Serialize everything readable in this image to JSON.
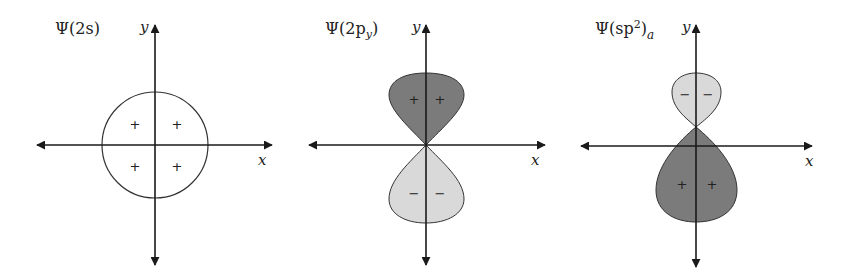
{
  "diagrams": [
    {
      "title": "Ψ(2s)",
      "title_main": "Ψ(2s)",
      "x_label": "x",
      "y_label": "y",
      "shape": "circle",
      "signs": [
        "+",
        "+",
        "+",
        "+"
      ]
    },
    {
      "title": "Ψ(2p_y)",
      "title_main": "Ψ(2p",
      "title_sub": "y",
      "title_close": ")",
      "x_label": "x",
      "y_label": "y",
      "shape": "p-orbital (two equal lobes along y)",
      "upper_lobe": {
        "sign": "+",
        "signs": [
          "+",
          "+"
        ],
        "fill": "#7b7b7b"
      },
      "lower_lobe": {
        "sign": "−",
        "signs": [
          "−",
          "−"
        ],
        "fill": "#d9d9d9"
      }
    },
    {
      "title": "Ψ(sp²)_a",
      "title_main": "Ψ(sp",
      "title_sup": "2",
      "title_close": ")",
      "title_sub": "a",
      "x_label": "x",
      "y_label": "y",
      "shape": "sp2 hybrid (small upper lobe, large lower lobe)",
      "upper_lobe": {
        "sign": "−",
        "signs": [
          "−",
          "−"
        ],
        "fill": "#d9d9d9"
      },
      "lower_lobe": {
        "sign": "+",
        "signs": [
          "+",
          "+"
        ],
        "fill": "#7b7b7b"
      }
    }
  ],
  "colors": {
    "axis": "#1a1a1a",
    "dark_lobe": "#7b7b7b",
    "light_lobe": "#d9d9d9",
    "outline": "#333333"
  }
}
